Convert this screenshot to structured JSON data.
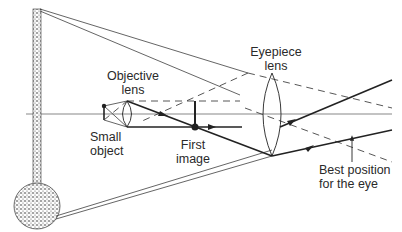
{
  "diagram": {
    "labels": {
      "objective_lens": [
        "Objective",
        "lens"
      ],
      "eyepiece_lens": [
        "Eyepiece",
        "lens"
      ],
      "small_object": [
        "Small",
        "object"
      ],
      "first_image": [
        "First",
        "image"
      ],
      "best_position": [
        "Best position",
        "for the eye"
      ]
    },
    "elements": {
      "final_image": "large virtual image (vertical stippled arrow with ball end)",
      "optical_axis": "horizontal principal axis",
      "objective": "small converging lens",
      "eyepiece": "large converging lens"
    },
    "colors": {
      "ink": "#222222",
      "background": "#ffffff"
    }
  }
}
